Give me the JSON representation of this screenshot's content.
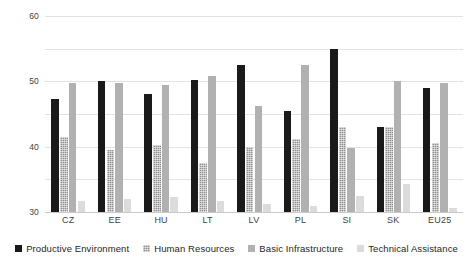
{
  "chart_data": {
    "type": "bar",
    "title": "",
    "subtitle": "",
    "xlabel": "",
    "ylabel": "",
    "ylim": [
      0,
      60
    ],
    "ytick_step": 10,
    "yticks": [
      0,
      10,
      20,
      30,
      40,
      50,
      60
    ],
    "grid": true,
    "legend_position": "bottom",
    "categories": [
      "CZ",
      "EE",
      "HU",
      "LT",
      "LV",
      "PL",
      "SI",
      "SK",
      "EU25"
    ],
    "series": [
      {
        "name": "Productive Environment",
        "color": "#1a1a1a",
        "values": [
          34.5,
          40.0,
          36.0,
          40.5,
          45.0,
          31.0,
          50.0,
          26.0,
          38.0
        ]
      },
      {
        "name": "Human Resources",
        "color": "#8f8f8f",
        "values": [
          23.0,
          19.0,
          20.5,
          15.0,
          20.0,
          22.5,
          26.0,
          26.0,
          21.0
        ]
      },
      {
        "name": "Basic Infrastructure",
        "color": "#b1b1b1",
        "values": [
          39.5,
          39.5,
          39.0,
          41.5,
          32.5,
          45.0,
          19.5,
          40.0,
          39.5
        ]
      },
      {
        "name": "Technical Assistance",
        "color": "#dcdcdc",
        "values": [
          3.3,
          4.0,
          4.5,
          3.3,
          2.5,
          1.7,
          5.0,
          8.5,
          1.3
        ]
      }
    ]
  }
}
